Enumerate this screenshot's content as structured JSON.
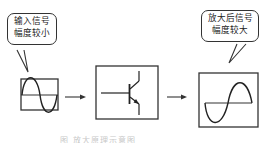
{
  "input_bubble": {
    "line1": "输入信号",
    "line2": "幅度较小"
  },
  "output_bubble": {
    "line1": "放大后信号",
    "line2": "幅度较大"
  },
  "caption": "图        放大原理示意图",
  "blocks": [
    {
      "id": "input",
      "content": "sine-wave-small"
    },
    {
      "id": "amplifier",
      "content": "npn-transistor-symbol"
    },
    {
      "id": "output",
      "content": "sine-wave-large"
    }
  ],
  "colors": {
    "stroke": "#333333",
    "background": "#ffffff"
  }
}
